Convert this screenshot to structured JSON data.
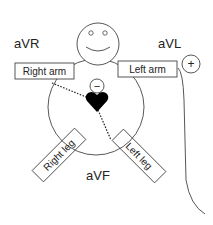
{
  "diagram": {
    "lead_labels": {
      "avr": "aVR",
      "avl": "aVL",
      "avf": "aVF"
    },
    "limb_labels": {
      "right_arm": "Right arm",
      "left_arm": "Left arm",
      "right_leg": "Right leg",
      "left_leg": "Left leg"
    },
    "electrodes": {
      "positive": "+",
      "negative": "−"
    },
    "colors": {
      "stroke": "#333333",
      "heart": "#000000",
      "background": "#ffffff"
    }
  }
}
